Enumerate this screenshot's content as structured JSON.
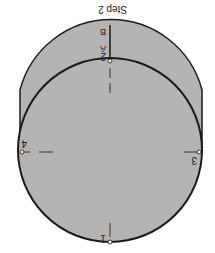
{
  "title": "Step 2",
  "points": {
    "p1": "1",
    "p2": "2",
    "p3": "3",
    "p4": "4",
    "A": "A",
    "B": "B"
  },
  "colors": {
    "fill": "#b4b4b4",
    "stroke": "#1a1a1a",
    "background": "#ffffff"
  }
}
